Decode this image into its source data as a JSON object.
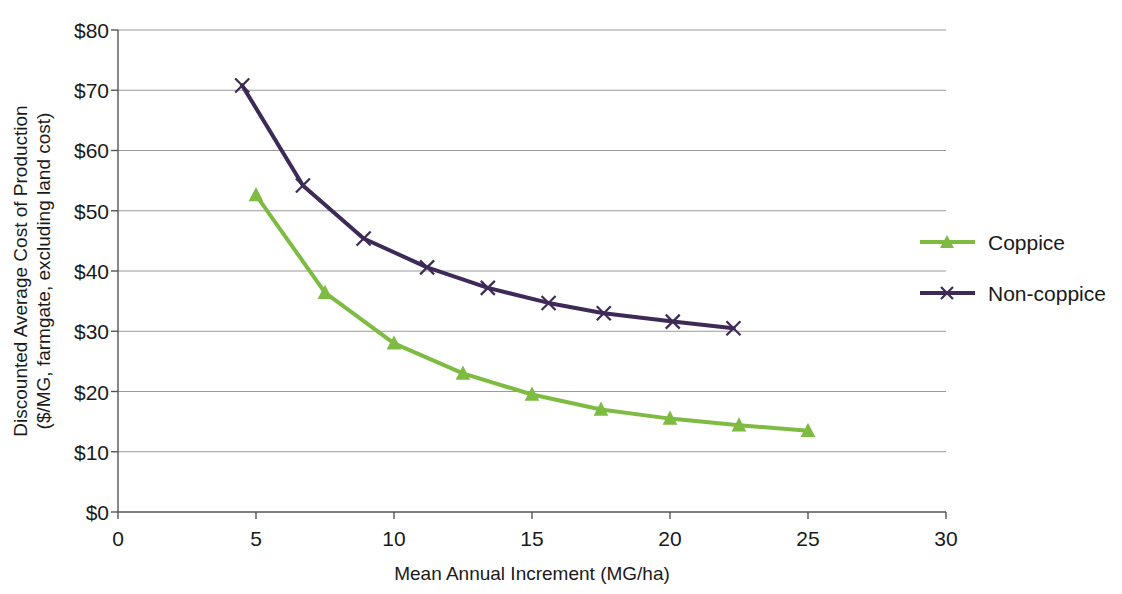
{
  "chart_data": {
    "type": "line",
    "title": "",
    "subtitle": "",
    "xlabel": "Mean Annual Increment (MG/ha)",
    "ylabel": "Discounted Average Cost of Production ($/MG, farmgate, excluding land cost)",
    "ylabel_line1": "Discounted Average Cost of Production",
    "ylabel_line2": "($/MG, farmgate, excluding land cost)",
    "xlim": [
      0,
      30
    ],
    "ylim": [
      0,
      80
    ],
    "xticks": [
      0,
      5,
      10,
      15,
      20,
      25,
      30
    ],
    "xtick_labels": [
      "0",
      "5",
      "10",
      "15",
      "20",
      "25",
      "30"
    ],
    "yticks": [
      0,
      10,
      20,
      30,
      40,
      50,
      60,
      70,
      80
    ],
    "ytick_labels": [
      "$0",
      "$10",
      "$20",
      "$30",
      "$40",
      "$50",
      "$60",
      "$70",
      "$80"
    ],
    "grid": "horizontal",
    "legend_position": "right",
    "series": [
      {
        "name": "Coppice",
        "color": "#7DBB42",
        "marker": "triangle",
        "points": [
          {
            "x": 5.0,
            "y": 52.6
          },
          {
            "x": 7.5,
            "y": 36.4
          },
          {
            "x": 10.0,
            "y": 28.0
          },
          {
            "x": 12.5,
            "y": 23.0
          },
          {
            "x": 15.0,
            "y": 19.5
          },
          {
            "x": 17.5,
            "y": 17.0
          },
          {
            "x": 20.0,
            "y": 15.5
          },
          {
            "x": 22.5,
            "y": 14.4
          },
          {
            "x": 25.0,
            "y": 13.5
          }
        ]
      },
      {
        "name": "Non-coppice",
        "color": "#3E2A56",
        "marker": "x",
        "points": [
          {
            "x": 4.5,
            "y": 70.8
          },
          {
            "x": 6.7,
            "y": 54.2
          },
          {
            "x": 8.9,
            "y": 45.4
          },
          {
            "x": 11.2,
            "y": 40.6
          },
          {
            "x": 13.4,
            "y": 37.2
          },
          {
            "x": 15.6,
            "y": 34.7
          },
          {
            "x": 17.6,
            "y": 33.0
          },
          {
            "x": 20.1,
            "y": 31.6
          },
          {
            "x": 22.3,
            "y": 30.5
          }
        ]
      }
    ]
  },
  "legend": {
    "items": [
      {
        "label": "Coppice",
        "color": "#7DBB42",
        "marker": "triangle"
      },
      {
        "label": "Non-coppice",
        "color": "#3E2A56",
        "marker": "x"
      }
    ]
  },
  "axes": {
    "x_title": "Mean Annual Increment (MG/ha)",
    "y_title_line1": "Discounted Average Cost of Production",
    "y_title_line2": "($/MG, farmgate, excluding land cost)",
    "x_tick_0": "0",
    "x_tick_1": "5",
    "x_tick_2": "10",
    "x_tick_3": "15",
    "x_tick_4": "20",
    "x_tick_5": "25",
    "x_tick_6": "30",
    "y_tick_0": "$0",
    "y_tick_1": "$10",
    "y_tick_2": "$20",
    "y_tick_3": "$30",
    "y_tick_4": "$40",
    "y_tick_5": "$50",
    "y_tick_6": "$60",
    "y_tick_7": "$70",
    "y_tick_8": "$80"
  },
  "colors": {
    "coppice": "#7DBB42",
    "non_coppice": "#3E2A56",
    "grid": "#999999",
    "axis": "#555555",
    "text": "#1a1a1a",
    "background": "#ffffff"
  }
}
